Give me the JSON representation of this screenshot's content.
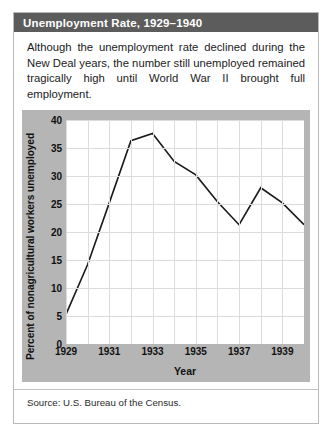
{
  "figure": {
    "title": "Unemployment Rate, 1929–1940",
    "caption": "Although the unemployment rate declined during the New Deal years, the number still unemployed remained tragically high until World War II brought full employment.",
    "source": "Source: U.S. Bureau of the Census.",
    "colors": {
      "title_bar": "#5c5c5c",
      "title_text": "#ffffff",
      "chart_panel": "#b5b5b5",
      "plot_background": "#ffffff",
      "gridline": "#dcdcdc",
      "line": "#1a1a1a",
      "card_border": "#b9b9b9"
    }
  },
  "chart_data": {
    "type": "line",
    "title": "Unemployment Rate, 1929–1940",
    "xlabel": "Year",
    "ylabel": "Percent of nonagricultural workers unemployed",
    "x": [
      1929,
      1930,
      1931,
      1932,
      1933,
      1934,
      1935,
      1936,
      1937,
      1938,
      1939,
      1940
    ],
    "values": [
      5.3,
      14.2,
      25.2,
      36.3,
      37.6,
      32.6,
      30.2,
      25.4,
      21.3,
      27.9,
      25.2,
      21.3
    ],
    "series": [
      {
        "name": "Percent of nonagricultural workers unemployed",
        "values": [
          5.3,
          14.2,
          25.2,
          36.3,
          37.6,
          32.6,
          30.2,
          25.4,
          21.3,
          27.9,
          25.2,
          21.3
        ]
      }
    ],
    "xlim": [
      1929,
      1940
    ],
    "ylim": [
      0,
      40
    ],
    "yticks": [
      0,
      5,
      10,
      15,
      20,
      25,
      30,
      35,
      40
    ],
    "ytick_labels": [
      "0",
      "5",
      "10",
      "15",
      "20",
      "25",
      "30",
      "35",
      "40"
    ],
    "xticks": [
      1929,
      1931,
      1933,
      1935,
      1937,
      1939
    ],
    "xtick_labels": [
      "1929",
      "1931",
      "1933",
      "1935",
      "1937",
      "1939"
    ],
    "grid": true,
    "legend": false
  }
}
